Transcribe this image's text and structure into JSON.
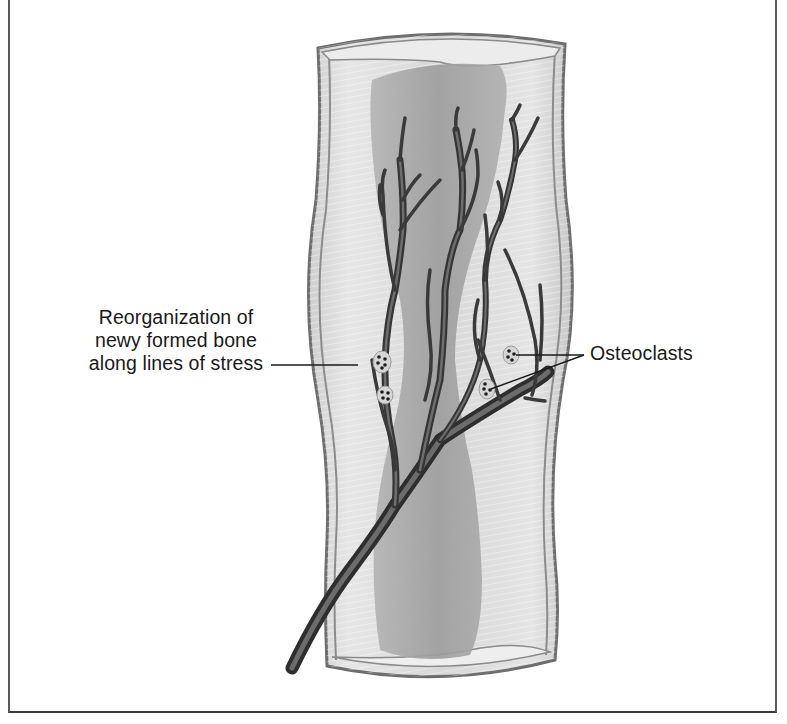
{
  "figure": {
    "colors": {
      "background": "#ffffff",
      "frame_border": "#4a4a4a",
      "bone_wall": "#8a8a8a",
      "cortex_fill": "#dcdcdc",
      "marrow_fill": "#a8a8a8",
      "vessel": "#4a4a4a",
      "text": "#1a1a1a"
    }
  },
  "labels": {
    "reorganization": {
      "lines": [
        "Reorganization of",
        "newy formed bone",
        "along lines of stress"
      ]
    },
    "osteoclasts": {
      "text": "Osteoclasts"
    }
  }
}
